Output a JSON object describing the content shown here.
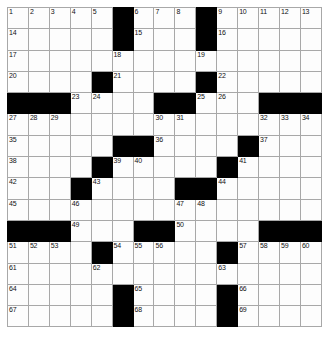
{
  "puzzle": {
    "title": "Crossword Grid",
    "rows": 15,
    "cols": 15,
    "cell_color": "#fdfdfd",
    "block_color": "#000000",
    "line_color": "#a8a8a8",
    "number_color": "#111111",
    "grid": [
      [
        "1",
        "2",
        "3",
        "4",
        "5",
        "#",
        "6",
        "7",
        "8",
        "#",
        "9",
        "10",
        "11",
        "12",
        "13"
      ],
      [
        "14",
        "",
        "",
        "",
        "",
        "#",
        "15",
        "",
        "",
        "#",
        "16",
        "",
        "",
        "",
        ""
      ],
      [
        "17",
        "",
        "",
        "",
        "",
        "18",
        "",
        "",
        "",
        "19",
        "",
        "",
        "",
        "",
        ""
      ],
      [
        "20",
        "",
        "",
        "",
        "#",
        "21",
        "",
        "",
        "",
        "#",
        "22",
        "",
        "",
        "",
        ""
      ],
      [
        "#",
        "#",
        "#",
        "23",
        "24",
        "",
        "",
        "#",
        "#",
        "25",
        "26",
        "",
        "#",
        "#",
        "#"
      ],
      [
        "27",
        "28",
        "29",
        "",
        "",
        "",
        "",
        "30",
        "31",
        "",
        "",
        "",
        "32",
        "33",
        "34"
      ],
      [
        "35",
        "",
        "",
        "",
        "",
        "#",
        "#",
        "36",
        "",
        "",
        "",
        "#",
        "37",
        "",
        ""
      ],
      [
        "38",
        "",
        "",
        "",
        "#",
        "39",
        "40",
        "",
        "",
        "",
        "#",
        "41",
        "",
        "",
        ""
      ],
      [
        "42",
        "",
        "",
        "#",
        "43",
        "",
        "",
        "",
        "#",
        "#",
        "44",
        "",
        "",
        "",
        ""
      ],
      [
        "45",
        "",
        "",
        "46",
        "",
        "",
        "",
        "",
        "47",
        "48",
        "",
        "",
        "",
        "",
        ""
      ],
      [
        "#",
        "#",
        "#",
        "49",
        "",
        "",
        "#",
        "#",
        "50",
        "",
        "",
        "",
        "#",
        "#",
        "#"
      ],
      [
        "51",
        "52",
        "53",
        "",
        "#",
        "54",
        "55",
        "56",
        "",
        "",
        "#",
        "57",
        "58",
        "59",
        "60"
      ],
      [
        "61",
        "",
        "",
        "",
        "62",
        "",
        "",
        "",
        "",
        "",
        "63",
        "",
        "",
        "",
        ""
      ],
      [
        "64",
        "",
        "",
        "",
        "",
        "#",
        "65",
        "",
        "",
        "",
        "#",
        "66",
        "",
        "",
        ""
      ],
      [
        "67",
        "",
        "",
        "",
        "",
        "#",
        "68",
        "",
        "",
        "",
        "#",
        "69",
        "",
        "",
        ""
      ]
    ]
  }
}
